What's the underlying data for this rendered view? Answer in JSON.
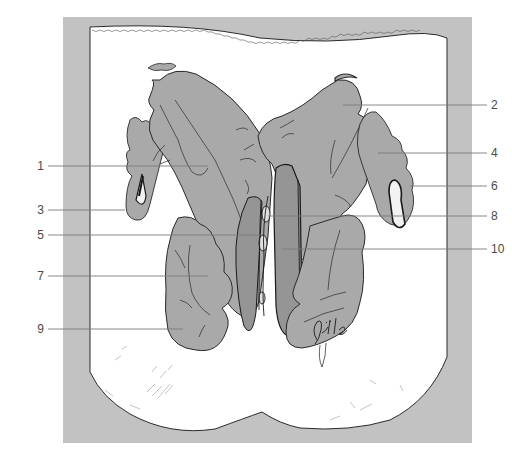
{
  "figure": {
    "type": "anatomical-illustration",
    "signature": "Jöller",
    "colors": {
      "frame": "#c2c2c2",
      "background": "#ffffff",
      "tissue": "#a9a9a9",
      "tissue_dark": "#959595",
      "outline": "#2a2a2a",
      "leader": "#7a7a7a",
      "label_text": "#4a4a4a"
    }
  },
  "labels": {
    "left": [
      {
        "id": "1",
        "text": "1",
        "y": 166
      },
      {
        "id": "3",
        "text": "3",
        "y": 210
      },
      {
        "id": "5",
        "text": "5",
        "y": 235
      },
      {
        "id": "7",
        "text": "7",
        "y": 276
      },
      {
        "id": "9",
        "text": "9",
        "y": 329
      }
    ],
    "right": [
      {
        "id": "2",
        "text": "2",
        "y": 105
      },
      {
        "id": "4",
        "text": "4",
        "y": 153
      },
      {
        "id": "6",
        "text": "6",
        "y": 186
      },
      {
        "id": "8",
        "text": "8",
        "y": 216
      },
      {
        "id": "10",
        "text": "10",
        "y": 249
      }
    ]
  }
}
